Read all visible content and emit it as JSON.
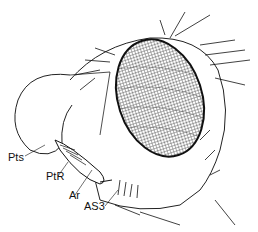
{
  "figure": {
    "labels": [
      {
        "id": "pts",
        "text": "Pts",
        "x": 8,
        "y": 157
      },
      {
        "id": "ptr",
        "text": "PtR",
        "x": 46,
        "y": 177
      },
      {
        "id": "ar",
        "text": "Ar",
        "x": 69,
        "y": 196
      },
      {
        "id": "as3",
        "text": "AS3",
        "x": 84,
        "y": 206
      }
    ]
  }
}
